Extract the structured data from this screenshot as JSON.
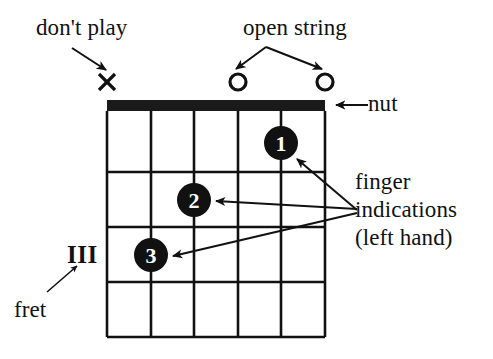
{
  "figure": {
    "kind": "guitar-chord-diagram",
    "background_color": "#ffffff",
    "ink_color": "#111111"
  },
  "labels": {
    "dont_play": "don't play",
    "open_string": "open string",
    "nut": "nut",
    "finger_line1": "finger",
    "finger_line2": "indications",
    "finger_line3": "(left hand)",
    "fret": "fret",
    "fret_number": "III"
  },
  "string_markers": [
    {
      "name": "marker-x-string-1",
      "glyph": "X",
      "x": 107,
      "y": 82,
      "meaning": "don't play"
    },
    {
      "name": "marker-o-string-4",
      "glyph": "O",
      "x": 238,
      "y": 82,
      "meaning": "open string"
    },
    {
      "name": "marker-o-string-6",
      "glyph": "O",
      "x": 325,
      "y": 82,
      "meaning": "open string"
    }
  ],
  "finger_dots": [
    {
      "label": "1",
      "x": 281,
      "y": 143,
      "radius": 17,
      "string": 5,
      "fret": 1
    },
    {
      "label": "2",
      "x": 194,
      "y": 200,
      "radius": 17,
      "string": 3,
      "fret": 2
    },
    {
      "label": "3",
      "x": 151,
      "y": 255,
      "radius": 17,
      "string": 2,
      "fret": 3
    }
  ],
  "grid": {
    "left": 107,
    "right": 325,
    "nut_top": 100,
    "nut_bottom": 111,
    "bottom": 337,
    "string_x": [
      107,
      151,
      194,
      238,
      281,
      325
    ],
    "fret_y": [
      111,
      172,
      227,
      282,
      337
    ],
    "string_count": 6,
    "fret_count": 4
  },
  "arrows": [
    {
      "name": "arrow-dont-play",
      "from": [
        72,
        48
      ],
      "to": [
        106,
        70
      ]
    },
    {
      "name": "arrow-open-string-left",
      "from": [
        266,
        47
      ],
      "to": [
        236,
        70
      ]
    },
    {
      "name": "arrow-open-string-right",
      "from": [
        266,
        47
      ],
      "to": [
        322,
        70
      ]
    },
    {
      "name": "arrow-nut",
      "from": [
        366,
        105
      ],
      "to": [
        335,
        105
      ]
    },
    {
      "name": "arrow-finger-1",
      "from": [
        357,
        210
      ],
      "to": [
        296,
        158
      ]
    },
    {
      "name": "arrow-finger-2",
      "from": [
        357,
        210
      ],
      "to": [
        215,
        201
      ]
    },
    {
      "name": "arrow-finger-3",
      "from": [
        357,
        213
      ],
      "to": [
        172,
        256
      ]
    },
    {
      "name": "arrow-fret",
      "from": [
        47,
        292
      ],
      "to": [
        76,
        266
      ]
    }
  ]
}
